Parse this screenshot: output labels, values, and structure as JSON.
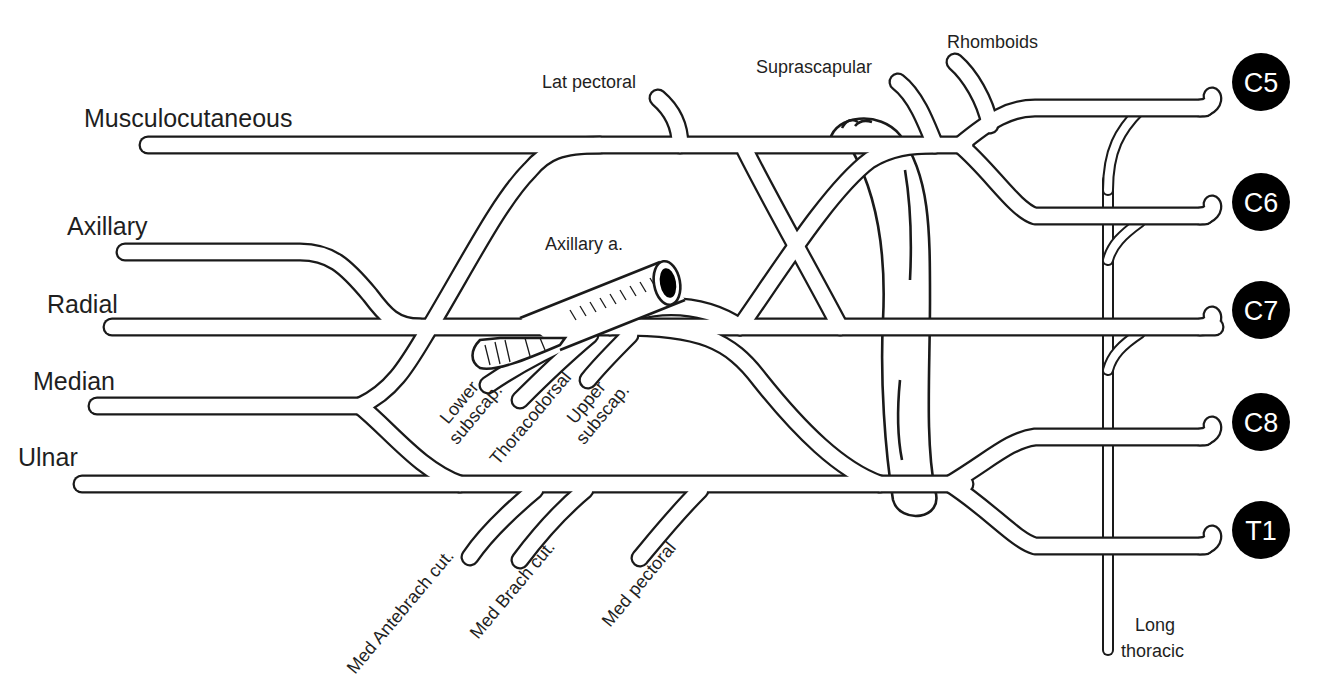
{
  "diagram": {
    "colors": {
      "line": "#1a1a1a",
      "background": "#ffffff",
      "root_badge": "#000000",
      "root_text": "#ffffff"
    },
    "terminal_nerves": {
      "musculocutaneous": "Musculocutaneous",
      "axillary": "Axillary",
      "radial": "Radial",
      "median": "Median",
      "ulnar": "Ulnar"
    },
    "roots": {
      "c5": "C5",
      "c6": "C6",
      "c7": "C7",
      "c8": "C8",
      "t1": "T1"
    },
    "branches": {
      "lat_pectoral": "Lat pectoral",
      "suprascapular": "Suprascapular",
      "rhomboids": "Rhomboids",
      "axillary_artery": "Axillary a.",
      "lower_subscap_line1": "Lower",
      "lower_subscap_line2": "subscap.",
      "thoracodorsal": "Thoracodorsal",
      "upper_subscap_line1": "Upper",
      "upper_subscap_line2": "subscap.",
      "med_antebrach_cut": "Med Antebrach cut.",
      "med_brach_cut": "Med Brach cut.",
      "med_pectoral": "Med pectoral",
      "long_thoracic_line1": "Long",
      "long_thoracic_line2": "thoracic"
    }
  }
}
